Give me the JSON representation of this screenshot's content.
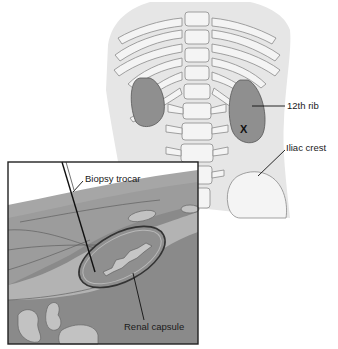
{
  "figure": {
    "type": "anatomical-illustration",
    "labels": {
      "rib": "12th rib",
      "iliac": "Iliac crest",
      "trocar": "Biopsy trocar",
      "capsule": "Renal capsule",
      "site_marker": "X"
    },
    "colors": {
      "background": "#ffffff",
      "torso": "#e6e6e6",
      "bone": "#f4f4f4",
      "bone_outline": "#8a8a8a",
      "kidney": "#8f8f8f",
      "kidney_outline": "#555555",
      "tissue_light": "#b3b3b3",
      "tissue_mid": "#9c9c9c",
      "tissue_dark": "#8a8a8a",
      "inset_border": "#222222",
      "text": "#1a1a1a"
    }
  }
}
